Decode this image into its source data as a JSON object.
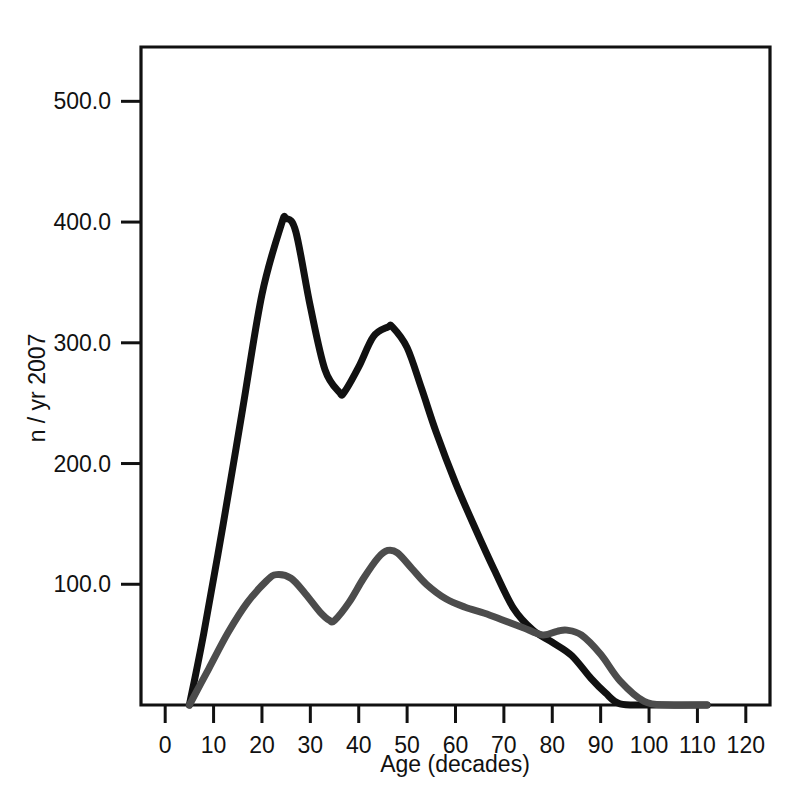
{
  "chart_data": {
    "type": "line",
    "title": "",
    "subtitle": "",
    "xlabel": "Age (decades)",
    "ylabel": "n / yr 2007",
    "xlim": [
      -5,
      125
    ],
    "ylim": [
      0,
      545
    ],
    "grid": false,
    "legend": "none",
    "x_ticks": [
      "0",
      "10",
      "20",
      "30",
      "40",
      "50",
      "60",
      "70",
      "80",
      "90",
      "100",
      "110",
      "120"
    ],
    "x_tick_values": [
      0,
      10,
      20,
      30,
      40,
      50,
      60,
      70,
      80,
      90,
      100,
      110,
      120
    ],
    "y_ticks": [
      "100.0",
      "200.0",
      "300.0",
      "400.0",
      "500.0"
    ],
    "y_tick_values": [
      100,
      200,
      300,
      400,
      500
    ],
    "series": [
      {
        "name": "black-curve",
        "color": "#111111",
        "width": 7,
        "x": [
          5,
          8,
          12,
          16,
          20,
          24,
          25,
          27,
          30,
          33,
          36,
          37,
          40,
          43,
          46,
          47,
          50,
          53,
          56,
          60,
          64,
          68,
          72,
          76,
          80,
          84,
          88,
          91,
          94,
          100,
          112
        ],
        "y": [
          0,
          60,
          150,
          245,
          340,
          398,
          403,
          392,
          330,
          278,
          259,
          259,
          280,
          305,
          313,
          313,
          296,
          262,
          226,
          184,
          147,
          112,
          80,
          62,
          52,
          41,
          22,
          10,
          1,
          0,
          0
        ]
      },
      {
        "name": "gray-curve",
        "color": "#4c4c4c",
        "width": 7,
        "x": [
          5,
          9,
          13,
          17,
          21,
          23,
          26,
          29,
          32,
          34,
          35,
          38,
          41,
          44,
          46,
          48,
          51,
          54,
          58,
          62,
          66,
          70,
          74,
          78,
          81,
          83,
          86,
          90,
          94,
          99,
          104,
          112
        ],
        "y": [
          0,
          30,
          60,
          85,
          103,
          108,
          105,
          92,
          77,
          70,
          70,
          85,
          105,
          122,
          128,
          126,
          113,
          100,
          88,
          81,
          76,
          70,
          64,
          58,
          61,
          62,
          58,
          42,
          20,
          3,
          0,
          0
        ]
      }
    ]
  },
  "axes": {
    "x_title": "Age (decades)",
    "y_title": "n / yr 2007"
  }
}
